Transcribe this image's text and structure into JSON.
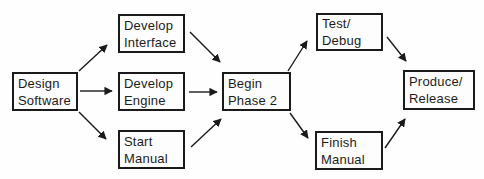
{
  "diagram": {
    "type": "flowchart",
    "background": "#fefefe",
    "box_fill": "#fdfdfd",
    "box_border_color": "#1a1a1a",
    "arrow_color": "#1a1a1a",
    "nodes": [
      {
        "id": "design-software",
        "label": "Design\nSoftware",
        "x": 12,
        "y": 72,
        "w": 66,
        "h": 39
      },
      {
        "id": "develop-interface",
        "label": "Develop\nInterface",
        "x": 118,
        "y": 14,
        "w": 67,
        "h": 39
      },
      {
        "id": "develop-engine",
        "label": "Develop\nEngine",
        "x": 118,
        "y": 72,
        "w": 67,
        "h": 39
      },
      {
        "id": "start-manual",
        "label": "Start\nManual",
        "x": 118,
        "y": 130,
        "w": 67,
        "h": 39
      },
      {
        "id": "begin-phase-2",
        "label": "Begin\nPhase 2",
        "x": 222,
        "y": 72,
        "w": 69,
        "h": 39
      },
      {
        "id": "test-debug",
        "label": "Test/\nDebug",
        "x": 316,
        "y": 13,
        "w": 67,
        "h": 38
      },
      {
        "id": "finish-manual",
        "label": "Finish\nManual",
        "x": 315,
        "y": 131,
        "w": 68,
        "h": 39
      },
      {
        "id": "produce-release",
        "label": "Produce/\nRelease",
        "x": 403,
        "y": 70,
        "w": 72,
        "h": 40
      }
    ],
    "edges": [
      {
        "from": "design-software",
        "to": "develop-interface",
        "x1": 79,
        "y1": 71,
        "x2": 107,
        "y2": 45
      },
      {
        "from": "design-software",
        "to": "develop-engine",
        "x1": 80,
        "y1": 91,
        "x2": 112,
        "y2": 91
      },
      {
        "from": "design-software",
        "to": "start-manual",
        "x1": 79,
        "y1": 112,
        "x2": 106,
        "y2": 139
      },
      {
        "from": "develop-interface",
        "to": "begin-phase-2",
        "x1": 190,
        "y1": 32,
        "x2": 220,
        "y2": 62
      },
      {
        "from": "develop-engine",
        "to": "begin-phase-2",
        "x1": 189,
        "y1": 92,
        "x2": 217,
        "y2": 92
      },
      {
        "from": "start-manual",
        "to": "begin-phase-2",
        "x1": 191,
        "y1": 147,
        "x2": 221,
        "y2": 119
      },
      {
        "from": "begin-phase-2",
        "to": "test-debug",
        "x1": 288,
        "y1": 71,
        "x2": 307,
        "y2": 41
      },
      {
        "from": "begin-phase-2",
        "to": "finish-manual",
        "x1": 290,
        "y1": 113,
        "x2": 308,
        "y2": 138
      },
      {
        "from": "test-debug",
        "to": "produce-release",
        "x1": 387,
        "y1": 37,
        "x2": 406,
        "y2": 61
      },
      {
        "from": "finish-manual",
        "to": "produce-release",
        "x1": 385,
        "y1": 148,
        "x2": 405,
        "y2": 119
      }
    ]
  }
}
